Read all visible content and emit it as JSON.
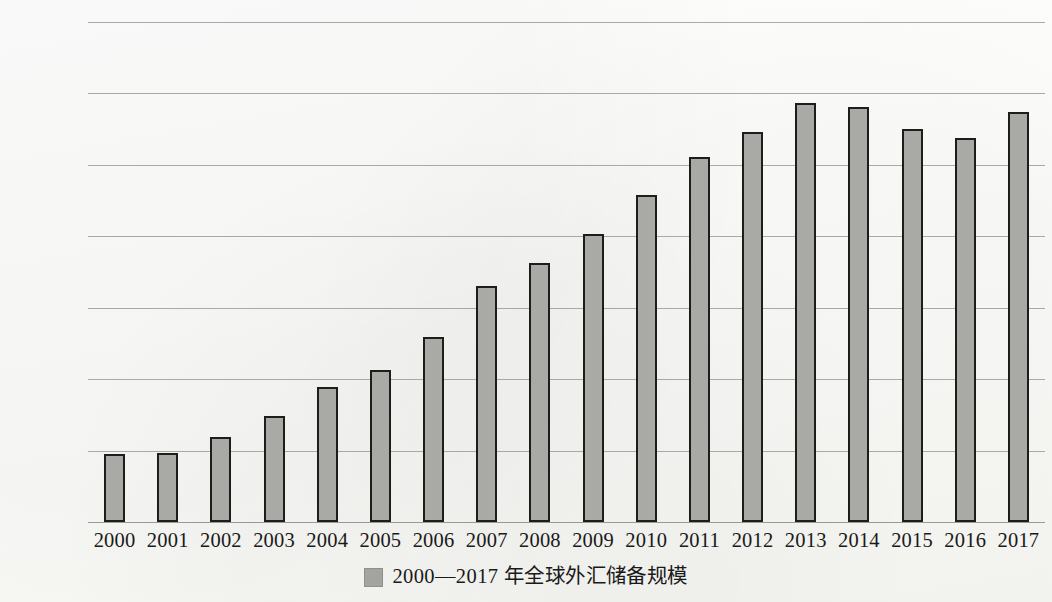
{
  "chart_data": {
    "type": "bar",
    "title": "",
    "subtitle": "",
    "xlabel": "",
    "ylabel": "",
    "categories": [
      "2000",
      "2001",
      "2002",
      "2003",
      "2004",
      "2005",
      "2006",
      "2007",
      "2008",
      "2009",
      "2010",
      "2011",
      "2012",
      "2013",
      "2014",
      "2015",
      "2016",
      "2017"
    ],
    "values": [
      19000,
      19300,
      23800,
      29800,
      37700,
      42600,
      51800,
      66200,
      72500,
      80600,
      91600,
      102200,
      109200,
      117300,
      116300,
      110000,
      107500,
      114700
    ],
    "series": [
      {
        "name": "2000—2017 年全球外汇储备规模",
        "values": [
          19000,
          19300,
          23800,
          29800,
          37700,
          42600,
          51800,
          66200,
          72500,
          80600,
          91600,
          102200,
          109200,
          117300,
          116300,
          110000,
          107500,
          114700
        ]
      }
    ],
    "ylim": [
      0,
      140000
    ],
    "y_ticks": [
      0,
      20000,
      40000,
      60000,
      80000,
      100000,
      120000,
      140000
    ],
    "y_tick_labels": [
      "0",
      "20 000",
      "40 000",
      "60 000",
      "80 000",
      "100 000",
      "120 000",
      "140 000"
    ],
    "grid": true,
    "grid_axis": "y",
    "legend_position": "bottom",
    "bar_color": "#a9a9a6",
    "bar_edge_color": "#1d1d1b",
    "grid_color": "#9b9b98",
    "legend": [
      {
        "label": "2000—2017 年全球外汇储备规模",
        "swatch_name": "legend-swatch-reserves",
        "color": "#a3a3a0"
      }
    ]
  }
}
